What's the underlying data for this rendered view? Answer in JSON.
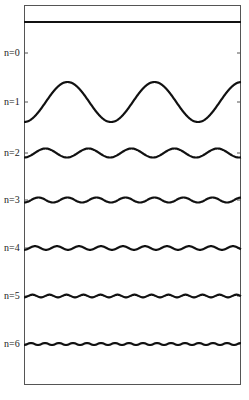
{
  "diagram": {
    "type": "wave-modes",
    "baseline_y": 22,
    "modes": [
      {
        "label": "n=0",
        "y": 53,
        "amplitude": 0,
        "period": 0
      },
      {
        "label": "n=1",
        "y": 102,
        "amplitude": 20,
        "period": 87
      },
      {
        "label": "n=2",
        "y": 153,
        "amplitude": 4.5,
        "period": 43
      },
      {
        "label": "n=3",
        "y": 200,
        "amplitude": 2.5,
        "period": 29
      },
      {
        "label": "n=4",
        "y": 248,
        "amplitude": 1.8,
        "period": 22
      },
      {
        "label": "n=5",
        "y": 296,
        "amplitude": 1.3,
        "period": 17
      },
      {
        "label": "n=6",
        "y": 344,
        "amplitude": 1.0,
        "period": 14
      }
    ],
    "footer": "(d)"
  }
}
